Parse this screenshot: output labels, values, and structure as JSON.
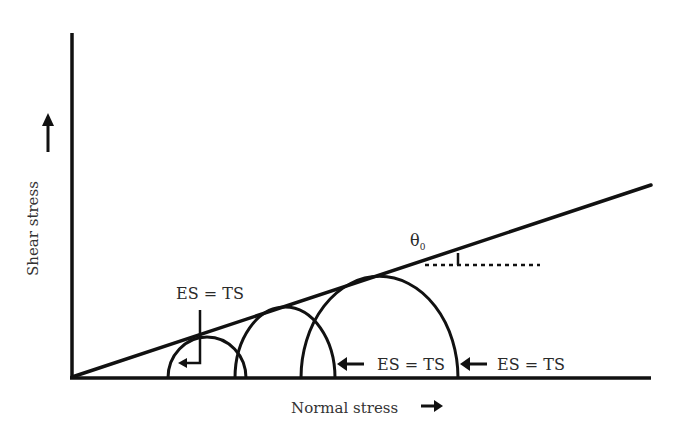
{
  "diagram": {
    "type": "Mohr-Coulomb failure envelope",
    "axes": {
      "x_label": "Normal stress",
      "y_label": "Shear stress"
    },
    "angle_label": "θ",
    "angle_subscript": "0",
    "annotations": [
      {
        "label": "ES = TS"
      },
      {
        "label": "ES = TS"
      },
      {
        "label": "ES = TS"
      }
    ],
    "circles": [
      {
        "center_x": 207,
        "radius": 39
      },
      {
        "center_x": 285,
        "radius": 50
      },
      {
        "center_x": 380,
        "radius": 78
      }
    ],
    "colors": {
      "stroke": "#111111",
      "text": "#2a2a2a"
    }
  }
}
